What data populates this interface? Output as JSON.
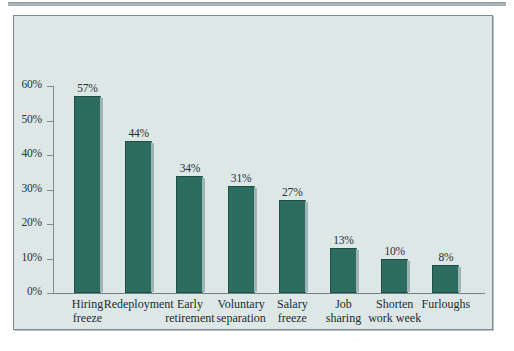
{
  "figure": {
    "background_color": "#dde7e6",
    "frame_border_color": "#7d8d92",
    "bar_color": "#2c6d60",
    "text_color": "#27313b",
    "bleed_text": "· · · ·"
  },
  "chart_data": {
    "type": "bar",
    "title": "",
    "subtitle": "",
    "xlabel": "",
    "ylabel": "",
    "ylim": [
      0,
      60
    ],
    "grid": false,
    "legend": null,
    "y_tick_labels": [
      "60%",
      "50%",
      "40%",
      "30%",
      "20%",
      "10%",
      "0%"
    ],
    "y_ticks": [
      60,
      50,
      40,
      30,
      20,
      10,
      0
    ],
    "categories": [
      "Hiring\nfreeze",
      "Redeployment",
      "Early\nretirement",
      "Voluntary\nseparation",
      "Salary\nfreeze",
      "Job\nsharing",
      "Shorten\nwork week",
      "Furloughs"
    ],
    "values": [
      57,
      44,
      34,
      31,
      27,
      13,
      10,
      8
    ],
    "data_labels": [
      "57%",
      "44%",
      "34%",
      "31%",
      "27%",
      "13%",
      "10%",
      "8%"
    ]
  }
}
